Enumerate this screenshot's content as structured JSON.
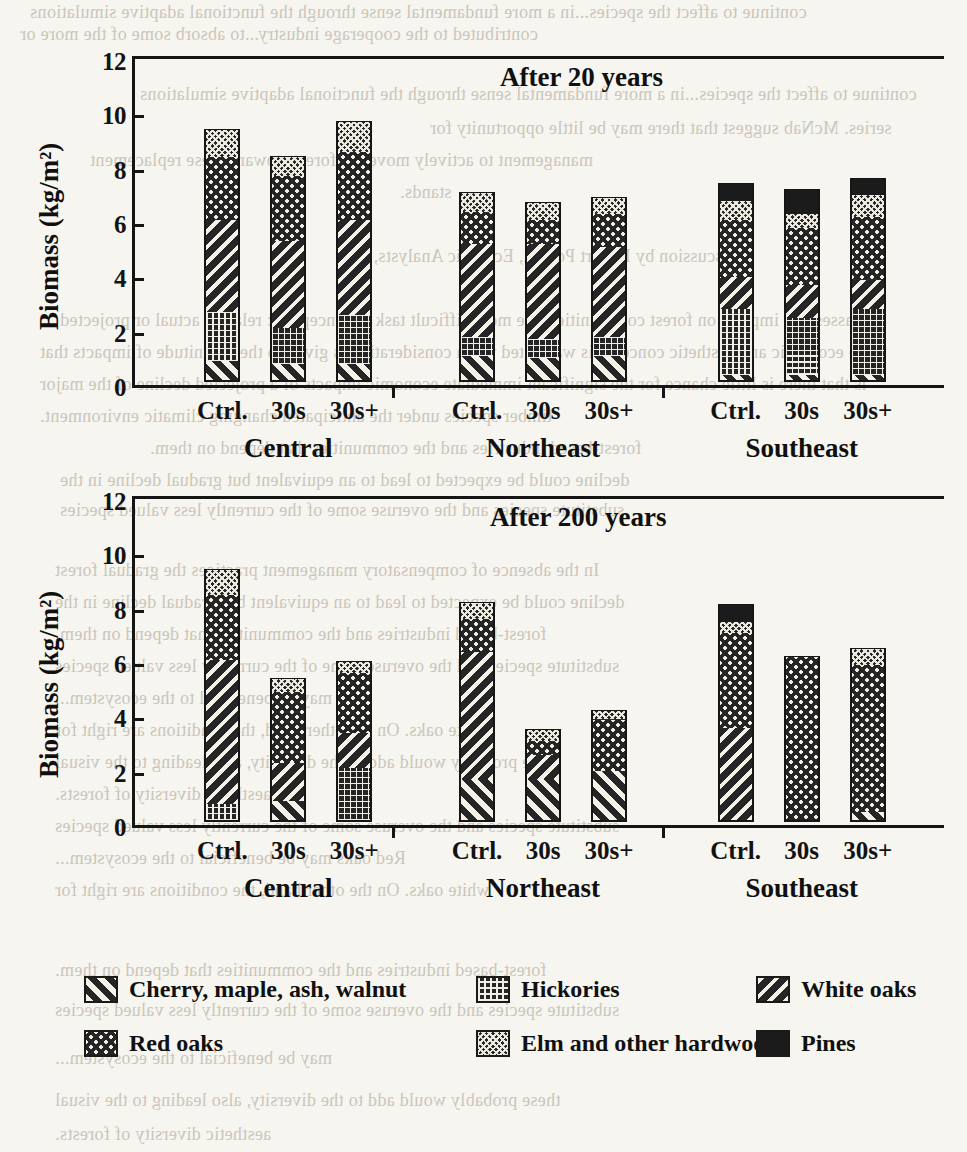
{
  "page": {
    "background_text_top": [
      "contributed to the cooperage industry...to absorb some of the more or",
      "continue to affect the species...in a more fundamental sense through the functional adaptive simulations",
      "series. McNab suggest that there may be little opportunity for",
      "management to actively move the forests toward these replacement",
      "stands."
    ],
    "background_text_mid": [
      "Discussion by Robert Powell, Ecologic Analysts, Inc.",
      "In assessing impacts on forest communities, the most difficult task is conceptual: relating actual or projected",
      "these economic and aesthetic concerns is warranted when consideration is given to the magnitude of impacts that",
      "is that there is little chance for the significant immediate economic impacts of a projected decline of the major",
      "timber species under the anticipated changing climatic environment."
    ],
    "background_text_bottom": [
      "In the absence of compensatory management practices the gradual forest",
      "decline could be expected to lead to an equivalent but gradual decline in the",
      "forest-based industries and the communities that depend on them.",
      "substitute species and the overuse some of the currently less valued species",
      "may be beneficial to the ecosystem...",
      "Red oaks may be beneficial to the ecosystem...",
      "white oaks. On the other hand, the conditions are right for",
      "these probably would add to the diversity, also leading to the visual",
      "aesthetic diversity of forests."
    ]
  },
  "charts": [
    {
      "id": "after-20-years",
      "title": "After 20 years",
      "ylabel": "Biomass (kg/m²)",
      "yticks": [
        0,
        2,
        4,
        6,
        8,
        10,
        12
      ],
      "ylim": [
        0,
        12
      ],
      "groups": [
        "Central",
        "Northeast",
        "Southeast"
      ],
      "bar_labels": [
        "Ctrl.",
        "30s",
        "30s+"
      ]
    },
    {
      "id": "after-200-years",
      "title": "After 200 years",
      "ylabel": "Biomass (kg/m²)",
      "yticks": [
        0,
        2,
        4,
        6,
        8,
        10,
        12
      ],
      "ylim": [
        0,
        12
      ],
      "groups": [
        "Central",
        "Northeast",
        "Southeast"
      ],
      "bar_labels": [
        "Ctrl.",
        "30s",
        "30s+"
      ]
    }
  ],
  "legend": {
    "items": [
      {
        "key": "cherry",
        "label": "Cherry, maple, ash, walnut",
        "pattern": "diagonal-stripe-right"
      },
      {
        "key": "hickories",
        "label": "Hickories",
        "pattern": "fine-grid"
      },
      {
        "key": "white_oaks",
        "label": "White oaks",
        "pattern": "diagonal-stripe-left"
      },
      {
        "key": "red_oaks",
        "label": "Red oaks",
        "pattern": "dots"
      },
      {
        "key": "elm",
        "label": "Elm and other hardwoods",
        "pattern": "dense-checker"
      },
      {
        "key": "pines",
        "label": "Pines",
        "pattern": "solid-black"
      }
    ]
  },
  "chart_data": [
    {
      "type": "bar",
      "subtype": "stacked",
      "title": "After 20 years",
      "xlabel": "",
      "ylabel": "Biomass (kg/m²)",
      "ylim": [
        0,
        12
      ],
      "yticks": [
        0,
        2,
        4,
        6,
        8,
        10,
        12
      ],
      "grid": false,
      "legend_position": "below-figure",
      "regions": [
        "Central",
        "Northeast",
        "Southeast"
      ],
      "categories": [
        "Central Ctrl.",
        "Central 30s",
        "Central 30s+",
        "Northeast Ctrl.",
        "Northeast 30s",
        "Northeast 30s+",
        "Southeast Ctrl.",
        "Southeast 30s",
        "Southeast 30s+"
      ],
      "series": [
        {
          "name": "Cherry, maple, ash, walnut",
          "values": [
            0.7,
            0.6,
            0.6,
            0.9,
            0.8,
            0.9,
            0.2,
            0.2,
            0.2
          ]
        },
        {
          "name": "Hickories",
          "values": [
            1.8,
            1.3,
            1.8,
            0.7,
            0.7,
            0.7,
            2.4,
            2.1,
            2.4
          ]
        },
        {
          "name": "White oaks",
          "values": [
            3.4,
            3.2,
            3.5,
            3.4,
            3.5,
            3.3,
            1.2,
            1.2,
            1.1
          ]
        },
        {
          "name": "Red oaks",
          "values": [
            2.3,
            2.4,
            2.5,
            1.2,
            0.9,
            1.2,
            2.1,
            2.1,
            2.3
          ]
        },
        {
          "name": "Elm and other hardwoods",
          "values": [
            1.0,
            0.7,
            1.1,
            0.7,
            0.6,
            0.6,
            0.7,
            0.5,
            0.8
          ]
        },
        {
          "name": "Pines",
          "values": [
            0.0,
            0.0,
            0.0,
            0.0,
            0.0,
            0.0,
            0.6,
            0.9,
            0.6
          ]
        }
      ],
      "totals": [
        9.2,
        8.2,
        9.5,
        6.9,
        6.5,
        6.7,
        7.2,
        7.0,
        7.4
      ]
    },
    {
      "type": "bar",
      "subtype": "stacked",
      "title": "After 200 years",
      "xlabel": "",
      "ylabel": "Biomass (kg/m²)",
      "ylim": [
        0,
        12
      ],
      "yticks": [
        0,
        2,
        4,
        6,
        8,
        10,
        12
      ],
      "grid": false,
      "legend_position": "below-figure",
      "regions": [
        "Central",
        "Northeast",
        "Southeast"
      ],
      "categories": [
        "Central Ctrl.",
        "Central 30s",
        "Central 30s+",
        "Northeast Ctrl.",
        "Northeast 30s",
        "Northeast 30s+",
        "Southeast Ctrl.",
        "Southeast 30s",
        "Southeast 30s+"
      ],
      "series": [
        {
          "name": "Cherry, maple, ash, walnut",
          "values": [
            0.0,
            0.7,
            0.0,
            1.5,
            1.5,
            1.8,
            0.0,
            0.0,
            0.3
          ]
        },
        {
          "name": "Hickories",
          "values": [
            0.6,
            0.0,
            1.9,
            0.0,
            0.0,
            0.0,
            0.0,
            0.0,
            0.0
          ]
        },
        {
          "name": "White oaks",
          "values": [
            5.3,
            1.4,
            1.3,
            4.7,
            0.9,
            0.0,
            3.4,
            0.0,
            0.0
          ]
        },
        {
          "name": "Red oaks",
          "values": [
            2.4,
            2.6,
            2.2,
            1.2,
            0.5,
            1.9,
            3.5,
            6.0,
            5.4
          ]
        },
        {
          "name": "Elm and other hardwoods",
          "values": [
            0.9,
            0.5,
            0.4,
            0.6,
            0.4,
            0.3,
            0.4,
            0.0,
            0.6
          ]
        },
        {
          "name": "Pines",
          "values": [
            0.0,
            0.0,
            0.0,
            0.0,
            0.0,
            0.0,
            0.6,
            0.0,
            0.0
          ]
        }
      ],
      "totals": [
        9.2,
        5.2,
        5.8,
        8.0,
        3.3,
        4.0,
        7.9,
        6.0,
        6.3
      ]
    }
  ]
}
